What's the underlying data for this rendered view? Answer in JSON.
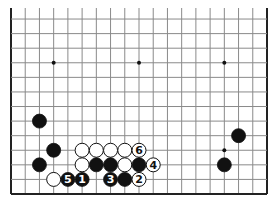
{
  "board": {
    "description": "Go board diagram, lower portion of a 19x19 board",
    "columns": 19,
    "visible_rows_from_bottom": 13,
    "edges": [
      "left",
      "right",
      "bottom"
    ],
    "colors": {
      "background": "#ffffff",
      "line": "#8a8a8a",
      "edge": "#222222",
      "black": "#111111",
      "white": "#ffffff"
    },
    "hoshi": [
      {
        "col": 3,
        "line": 10
      },
      {
        "col": 9,
        "line": 10
      },
      {
        "col": 15,
        "line": 10
      },
      {
        "col": 15,
        "line": 4
      }
    ],
    "stones": [
      {
        "color": "black",
        "col": 2,
        "line": 6,
        "label": ""
      },
      {
        "color": "black",
        "col": 3,
        "line": 4,
        "label": ""
      },
      {
        "color": "black",
        "col": 2,
        "line": 3,
        "label": ""
      },
      {
        "color": "white",
        "col": 5,
        "line": 4,
        "label": ""
      },
      {
        "color": "white",
        "col": 6,
        "line": 4,
        "label": ""
      },
      {
        "color": "white",
        "col": 7,
        "line": 4,
        "label": ""
      },
      {
        "color": "white",
        "col": 8,
        "line": 4,
        "label": ""
      },
      {
        "color": "white",
        "col": 9,
        "line": 4,
        "label": "6"
      },
      {
        "color": "white",
        "col": 5,
        "line": 3,
        "label": ""
      },
      {
        "color": "black",
        "col": 6,
        "line": 3,
        "label": ""
      },
      {
        "color": "black",
        "col": 7,
        "line": 3,
        "label": ""
      },
      {
        "color": "white",
        "col": 8,
        "line": 3,
        "label": ""
      },
      {
        "color": "black",
        "col": 9,
        "line": 3,
        "label": ""
      },
      {
        "color": "white",
        "col": 10,
        "line": 3,
        "label": "4"
      },
      {
        "color": "white",
        "col": 3,
        "line": 2,
        "label": ""
      },
      {
        "color": "black",
        "col": 4,
        "line": 2,
        "label": "5"
      },
      {
        "color": "black",
        "col": 5,
        "line": 2,
        "label": "1"
      },
      {
        "color": "black",
        "col": 7,
        "line": 2,
        "label": "3"
      },
      {
        "color": "black",
        "col": 8,
        "line": 2,
        "label": ""
      },
      {
        "color": "white",
        "col": 9,
        "line": 2,
        "label": "2"
      },
      {
        "color": "black",
        "col": 16,
        "line": 5,
        "label": ""
      },
      {
        "color": "black",
        "col": 15,
        "line": 3,
        "label": ""
      }
    ]
  }
}
